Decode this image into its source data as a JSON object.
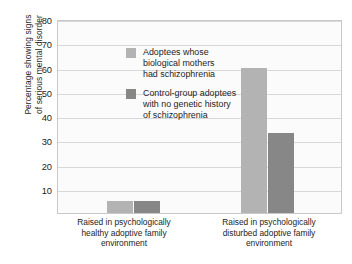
{
  "chart_data": {
    "type": "bar",
    "title": "",
    "subtitle": "",
    "xlabel": "",
    "ylabel": "Percentage showing signs of serious mental disorder",
    "ylabel_lines": [
      "Percentage showing signs",
      "of serious mental disorder"
    ],
    "ylim": [
      0,
      80
    ],
    "ytick_values": [
      80,
      70,
      60,
      50,
      40,
      30,
      20,
      10
    ],
    "ytick_labels": [
      "80",
      "70",
      "60",
      "50",
      "40",
      "30",
      "20",
      "10"
    ],
    "grid": true,
    "grid_orientation": "horizontal",
    "legend_position": "inside-upper-left",
    "categories": [
      "Raised in psychologically healthy adoptive family environment",
      "Raised in psychologically disturbed adoptive family environment"
    ],
    "category_lines": [
      [
        "Raised in psychologically",
        "healthy adoptive family",
        "environment"
      ],
      [
        "Raised in psychologically",
        "disturbed adoptive family",
        "environment"
      ]
    ],
    "series": [
      {
        "name": "Adoptees whose biological mothers had schizophrenia",
        "name_lines": [
          "Adoptees whose",
          "biological mothers",
          "had schizophrenia"
        ],
        "color": "#b3b3b3",
        "values": [
          5,
          60
        ]
      },
      {
        "name": "Control-group adoptees with no genetic history of schizophrenia",
        "name_lines": [
          "Control-group adoptees",
          "with no genetic history",
          "of schizophrenia"
        ],
        "color": "#878787",
        "values": [
          5,
          33
        ]
      }
    ]
  },
  "colors": {
    "series_light": "#b3b3b3",
    "series_dark": "#878787",
    "plot_background": "#fbfbfb",
    "plot_border": "#c9c9c9",
    "gridline": "#d8d8d8",
    "text": "#1d1d1d",
    "page_background": "#ffffff"
  }
}
